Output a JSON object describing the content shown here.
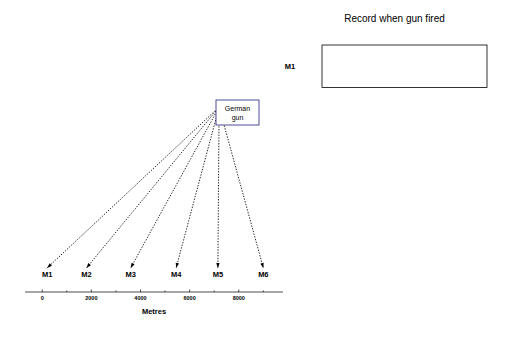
{
  "figure": {
    "width": 511,
    "height": 340,
    "background": "#ffffff",
    "ink": "#000000"
  },
  "left_panel": {
    "name": "microphone-layout-diagram",
    "xlabel": "Metres",
    "tick_labels": [
      "0",
      "2000",
      "4000",
      "6000",
      "8000"
    ],
    "tick_values": [
      0,
      2000,
      4000,
      6000,
      8000
    ],
    "axis_range": [
      -700,
      9800
    ],
    "source": {
      "label_line1": "German",
      "label_line2": "gun",
      "x_metres": 7200,
      "y_px": 103,
      "marker": "filled-circle"
    },
    "microphones": [
      {
        "label": "M1",
        "x_metres": 200
      },
      {
        "label": "M2",
        "x_metres": 1800
      },
      {
        "label": "M3",
        "x_metres": 3600
      },
      {
        "label": "M4",
        "x_metres": 5450
      },
      {
        "label": "M5",
        "x_metres": 7150
      },
      {
        "label": "M6",
        "x_metres": 9000
      }
    ]
  },
  "right_panel": {
    "name": "sound-record-traces",
    "title": "Record when gun fired",
    "xlabel": "Seconds",
    "row_labels": [
      "M1",
      "M2",
      "M3",
      "M4",
      "M5",
      "M6"
    ],
    "tick_labels": [
      "0",
      "2",
      "4",
      "6"
    ],
    "tick_values": [
      0,
      2,
      4,
      6
    ]
  },
  "chart_data": {
    "type": "line",
    "title": "Record when gun fired",
    "xlabel": "Seconds",
    "ylabel": "",
    "xlim": [
      -0.25,
      7.2
    ],
    "grid": false,
    "legend": "none",
    "panel_layout": "stacked",
    "series": [
      {
        "name": "M1",
        "peak_time_s": 6.72,
        "peak_amplitude": 1.0,
        "baseline": 0.06
      },
      {
        "name": "M2",
        "peak_time_s": 3.62,
        "peak_amplitude": 1.0,
        "baseline": 0.06
      },
      {
        "name": "M3",
        "peak_time_s": 1.42,
        "peak_amplitude": 1.0,
        "baseline": 0.06
      },
      {
        "name": "M4",
        "peak_time_s": 0.28,
        "peak_amplitude": 1.0,
        "baseline": 0.06
      },
      {
        "name": "M5",
        "peak_time_s": 0.32,
        "peak_amplitude": 1.0,
        "baseline": 0.06
      },
      {
        "name": "M6",
        "peak_time_s": 1.3,
        "peak_amplitude": 1.0,
        "baseline": 0.06
      }
    ],
    "categories": [
      "M1",
      "M2",
      "M3",
      "M4",
      "M5",
      "M6"
    ],
    "values": [
      6.72,
      3.62,
      1.42,
      0.28,
      0.32,
      1.3
    ]
  }
}
